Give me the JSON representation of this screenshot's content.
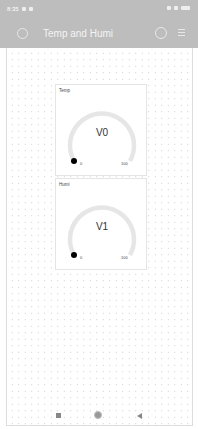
{
  "status_bar": {
    "time": "8:35",
    "icons": [
      "signal-icon",
      "wifi-icon",
      "battery-icon"
    ]
  },
  "app_bar": {
    "title": "Temp and Humi",
    "back_icon": "back-icon",
    "settings_icon": "settings-icon",
    "menu_icon": "menu-icon"
  },
  "widgets": [
    {
      "label": "Temp",
      "value": "V0",
      "min": "0",
      "max": "100"
    },
    {
      "label": "Humi",
      "value": "V1",
      "min": "0",
      "max": "100"
    }
  ],
  "nav_bar": {
    "items": [
      "recent-apps",
      "home",
      "back"
    ]
  }
}
